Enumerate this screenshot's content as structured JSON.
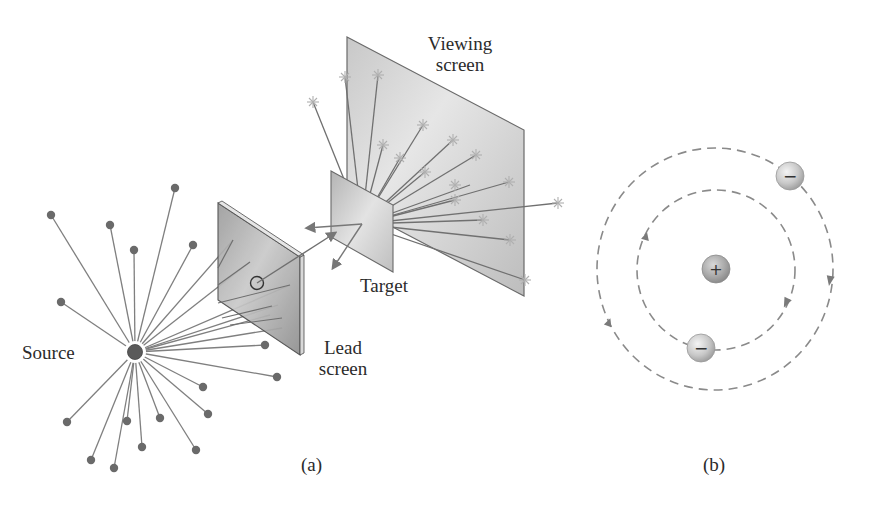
{
  "figure": {
    "panel_a": {
      "caption": "(a)",
      "labels": {
        "source": "Source",
        "lead_screen_line1": "Lead",
        "lead_screen_line2": "screen",
        "target": "Target",
        "viewing_screen_line1": "Viewing",
        "viewing_screen_line2": "screen"
      },
      "source_center": [
        135,
        352
      ],
      "blocked_particles": [
        [
          51,
          215
        ],
        [
          110,
          225
        ],
        [
          134,
          250
        ],
        [
          175,
          188
        ],
        [
          193,
          245
        ],
        [
          61,
          302
        ],
        [
          265,
          345
        ],
        [
          277,
          377
        ],
        [
          203,
          387
        ],
        [
          208,
          414
        ],
        [
          160,
          418
        ],
        [
          127,
          421
        ],
        [
          67,
          422
        ],
        [
          91,
          460
        ],
        [
          114,
          468
        ],
        [
          142,
          447
        ],
        [
          196,
          450
        ]
      ],
      "lead_screen_rays_end": [
        [
          233,
          233
        ],
        [
          250,
          262
        ],
        [
          290,
          285
        ],
        [
          288,
          305
        ],
        [
          270,
          315
        ],
        [
          282,
          327
        ]
      ],
      "target_impact": [
        362,
        224
      ],
      "scatter_hits": [
        [
          378,
          75
        ],
        [
          345,
          77
        ],
        [
          313,
          102
        ],
        [
          423,
          125
        ],
        [
          383,
          145
        ],
        [
          362,
          175
        ],
        [
          400,
          158
        ],
        [
          453,
          140
        ],
        [
          476,
          155
        ],
        [
          425,
          172
        ],
        [
          470,
          185
        ],
        [
          483,
          220
        ],
        [
          509,
          182
        ],
        [
          455,
          200
        ],
        [
          453,
          207
        ],
        [
          510,
          240
        ],
        [
          525,
          280
        ],
        [
          558,
          203
        ]
      ],
      "back_scatter_arrows": [
        [
          305,
          228
        ],
        [
          332,
          270
        ]
      ]
    },
    "panel_b": {
      "caption": "(b)",
      "nucleus_symbol": "+",
      "electron_symbol": "−"
    },
    "colors": {
      "line": "#7a7a7a",
      "dot": "#6a6a6a",
      "star": "#b8b8b8",
      "text": "#2b2b2b",
      "orbit": "#8a8a8a"
    }
  }
}
